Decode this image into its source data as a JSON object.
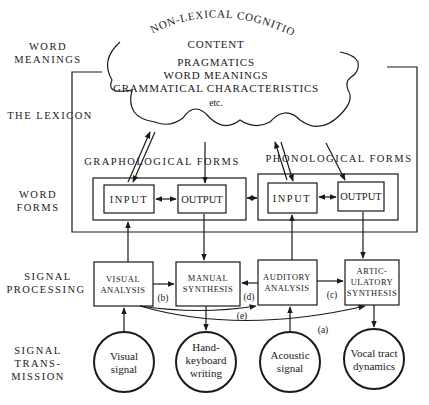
{
  "title_arc": "NON-LEXICAL COGNITION",
  "cloud": {
    "line1": "CONTENT",
    "line2": "PRAGMATICS",
    "line3": "WORD MEANINGS",
    "line4": "GRAMMATICAL CHARACTERISTICS",
    "line5": "etc."
  },
  "levels": {
    "word_meanings_1": "WORD",
    "word_meanings_2": "MEANINGS",
    "lexicon": "THE LEXICON",
    "word_forms_1": "WORD",
    "word_forms_2": "FORMS",
    "signal_processing_1": "SIGNAL",
    "signal_processing_2": "PROCESSING",
    "signal_transmission_1": "SIGNAL",
    "signal_transmission_2": "TRANS-",
    "signal_transmission_3": "MISSION"
  },
  "forms": {
    "graphological": "GRAPHOLOGICAL FORMS",
    "phonological": "PHONOLOGICAL FORMS",
    "input": "INPUT",
    "output": "OUTPUT"
  },
  "processing": {
    "visual_1": "VISUAL",
    "visual_2": "ANALYSIS",
    "manual_1": "MANUAL",
    "manual_2": "SYNTHESIS",
    "auditory_1": "AUDITORY",
    "auditory_2": "ANALYSIS",
    "artic_1": "ARTIC-",
    "artic_2": "ULATORY",
    "artic_3": "SYNTHESIS"
  },
  "routes": {
    "a": "(a)",
    "b": "(b)",
    "c": "(c)",
    "d": "(d)",
    "e": "(e)"
  },
  "transmission": {
    "visual_1": "Visual",
    "visual_2": "signal",
    "hand_1": "Hand-",
    "hand_2": "keyboard",
    "hand_3": "writing",
    "acoustic_1": "Acoustic",
    "acoustic_2": "signal",
    "vocal_1": "Vocal tract",
    "vocal_2": "dynamics"
  }
}
